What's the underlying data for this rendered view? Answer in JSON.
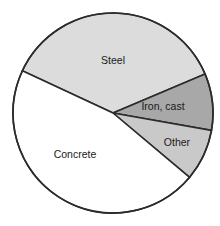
{
  "chart_data": {
    "type": "pie",
    "title": "",
    "subtitle": "",
    "xlabel": "",
    "ylabel": "",
    "legend_position": "none",
    "grid": false,
    "labels_inside_slices": true,
    "categories": [
      "Steel",
      "Iron, cast",
      "Other",
      "Concrete"
    ],
    "values": [
      36.6,
      9.2,
      8.3,
      45.9
    ],
    "value_unit": "percent",
    "colors": [
      "#dcdcdc",
      "#a8a8a8",
      "#c9c9c9",
      "#ffffff"
    ],
    "outline_color": "#2b2b2b",
    "start_angle_deg": 205,
    "direction": "clockwise",
    "slices": [
      {
        "label": "Steel",
        "value": 36.6,
        "color": "#dcdcdc",
        "start_deg": 205,
        "end_deg": 337,
        "label_x": 113,
        "label_y": 61
      },
      {
        "label": "Iron, cast",
        "value": 9.2,
        "color": "#a8a8a8",
        "start_deg": 337,
        "end_deg": 370,
        "label_x": 163,
        "label_y": 107
      },
      {
        "label": "Other",
        "value": 8.3,
        "color": "#c9c9c9",
        "start_deg": 370,
        "end_deg": 400,
        "label_x": 177,
        "label_y": 143
      },
      {
        "label": "Concrete",
        "value": 45.9,
        "color": "#ffffff",
        "start_deg": 400,
        "end_deg": 565,
        "label_x": 75,
        "label_y": 155
      }
    ],
    "geometry": {
      "center_x": 113,
      "center_y": 113,
      "radius": 100
    }
  }
}
